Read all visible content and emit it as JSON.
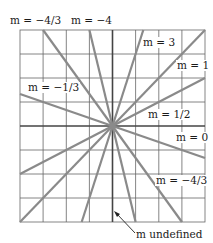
{
  "figure": {
    "grid": {
      "cols": 8,
      "rows": 8,
      "color": "#555555"
    },
    "line_color": "#8a8a8a",
    "axis_color": "#333333",
    "lines": [
      {
        "slope": "3",
        "m": 3
      },
      {
        "slope": "1",
        "m": 1
      },
      {
        "slope": "1/2",
        "m": 0.5
      },
      {
        "slope": "0",
        "m": 0
      },
      {
        "slope": "-1/3",
        "m": -0.3333
      },
      {
        "slope": "-4/3",
        "m": -1.3333
      },
      {
        "slope": "-4",
        "m": -4
      },
      {
        "slope": "undefined",
        "m": null
      }
    ],
    "labels": {
      "m_neg43_top": "m = −4/3",
      "m_neg4": "m = −4",
      "m_3": "m = 3",
      "m_1": "m = 1",
      "m_neg13": "m = −1/3",
      "m_12": "m = 1/2",
      "m_0": "m = 0",
      "m_neg43": "m = −4/3",
      "m_undef": "m undefined"
    }
  }
}
